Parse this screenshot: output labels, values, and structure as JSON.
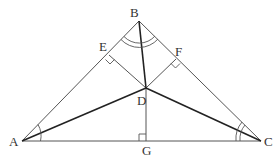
{
  "diagram": {
    "title": "",
    "points": {
      "A": {
        "label": "A",
        "x": 22,
        "y": 141
      },
      "B": {
        "label": "B",
        "x": 139,
        "y": 21
      },
      "C": {
        "label": "C",
        "x": 261,
        "y": 141
      },
      "D": {
        "label": "D",
        "x": 146,
        "y": 88
      },
      "E": {
        "label": "E",
        "x": 109,
        "y": 55
      },
      "F": {
        "label": "F",
        "x": 176,
        "y": 59
      },
      "G": {
        "label": "G",
        "x": 146,
        "y": 141
      }
    },
    "segments": [
      {
        "from": "A",
        "to": "B",
        "style": "thin"
      },
      {
        "from": "B",
        "to": "C",
        "style": "thin"
      },
      {
        "from": "A",
        "to": "C",
        "style": "thin"
      },
      {
        "from": "B",
        "to": "D",
        "style": "thick"
      },
      {
        "from": "A",
        "to": "D",
        "style": "thick"
      },
      {
        "from": "C",
        "to": "D",
        "style": "thick"
      },
      {
        "from": "D",
        "to": "E",
        "style": "thin"
      },
      {
        "from": "D",
        "to": "F",
        "style": "thin"
      },
      {
        "from": "D",
        "to": "G",
        "style": "thin"
      }
    ],
    "right_angles": [
      "E",
      "F",
      "G"
    ],
    "angle_marks": [
      {
        "vertex": "A",
        "arcs": 1
      },
      {
        "vertex": "B",
        "arcs": 2
      },
      {
        "vertex": "C",
        "arcs": 2
      }
    ],
    "colors": {
      "line": "#555555",
      "bold_line": "#222222",
      "label": "#333333",
      "background": "#ffffff"
    }
  }
}
